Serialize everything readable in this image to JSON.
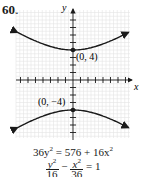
{
  "problem_number": "60.",
  "chart_data": {
    "type": "line",
    "title": "",
    "xlabel": "x",
    "ylabel": "y",
    "xlim": [
      -7.5,
      7.5
    ],
    "ylim": [
      -7,
      9
    ],
    "grid": true,
    "curve": "hyperbola y^2/16 - x^2/36 = 1 (vertical transverse axis)",
    "series": [
      {
        "name": "upper branch",
        "x": [
          -7,
          -6,
          -4,
          -2,
          0,
          2,
          4,
          6,
          7
        ],
        "y": [
          6.15,
          5.66,
          4.81,
          4.22,
          4,
          4.22,
          4.81,
          5.66,
          6.15
        ]
      },
      {
        "name": "lower branch",
        "x": [
          -7,
          -6,
          -4,
          -2,
          0,
          2,
          4,
          6,
          7
        ],
        "y": [
          -6.15,
          -5.66,
          -4.81,
          -4.22,
          -4,
          -4.22,
          -4.81,
          -5.66,
          -6.15
        ]
      }
    ],
    "points": [
      {
        "x": 0,
        "y": 4,
        "label": "(0, 4)"
      },
      {
        "x": 0,
        "y": -4,
        "label": "(0, −4)"
      }
    ],
    "annotations": [
      "36y² = 576 + 16x²",
      "y²/16 − x²/36 = 1"
    ]
  },
  "labels": {
    "x_axis": "x",
    "y_axis": "y",
    "vertex_top": "(0, 4)",
    "vertex_bottom": "(0, −4)"
  },
  "equations": {
    "eq1_a": "36y",
    "eq1_b": " = 576 + 16x",
    "sq": "2",
    "eq2_num1": "y",
    "eq2_den1": "16",
    "eq2_minus": " − ",
    "eq2_num2": "x",
    "eq2_den2": "36",
    "eq2_rhs": " = 1"
  }
}
